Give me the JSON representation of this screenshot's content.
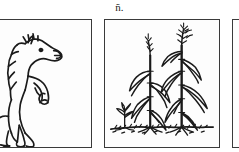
{
  "figure": {
    "caption": "ñ.",
    "background_color": "#ffffff",
    "ink_color": "#1a1a1a",
    "border_color": "#3a3a3a",
    "panel_fill": "#fdfdfd",
    "panel_count": 3,
    "layout": "three bordered illustration panels in a horizontal row; first and third panels cropped by the image edges"
  },
  "panels": [
    {
      "id": "panel-horse",
      "position": "left",
      "subject": "rearing horse",
      "description": "black ink line drawing of a horse rearing on its hind legs, spiky mane, raised forelegs, flowing tail",
      "cropped": "left edge cut off",
      "icon": "horse-illustration"
    },
    {
      "id": "panel-maize",
      "position": "center",
      "subject": "maize plants",
      "description": "two tall corn / maize plants with tasseled tops and drooping leaves, a small seedling sprout at lower left, rough ground line with soil clumps",
      "cropped": "fully visible",
      "icon": "maize-illustration"
    },
    {
      "id": "panel-third",
      "position": "right",
      "subject": "",
      "description": "third panel, only the left border visible at the right edge of the image",
      "cropped": "right edge cut off",
      "icon": "empty-panel"
    }
  ]
}
